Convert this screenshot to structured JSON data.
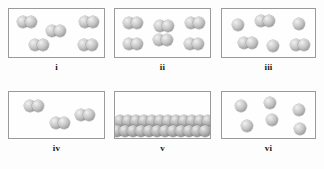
{
  "figure": {
    "title": "",
    "box_border_color": "#9a9a9a",
    "background_color": "#fdfdfd",
    "atom_fill_light": "#f2f2f2",
    "atom_fill_dark": "#787878"
  },
  "chart_data": {
    "type": "diagram",
    "title": "",
    "xlabel": "",
    "ylabel": "",
    "legend": [],
    "categories": [
      "i",
      "ii",
      "iii",
      "iv",
      "v",
      "vi"
    ],
    "values": [
      10,
      12,
      9,
      6,
      24,
      6
    ],
    "series": [
      {
        "name": "diatomic molecules",
        "values": [
          5,
          6,
          3,
          3,
          0,
          0
        ]
      },
      {
        "name": "single atoms",
        "values": [
          0,
          0,
          3,
          0,
          24,
          6
        ]
      }
    ]
  },
  "panels": [
    {
      "id": "i",
      "label": "i",
      "particle_count": 10,
      "molecule_count": 5,
      "single_atom_count": 0,
      "description": "five diatomic molecules spread in box",
      "box": {
        "x": 8,
        "y": 8,
        "w": 97,
        "h": 50
      },
      "label_pos": {
        "x": 8,
        "y": 62,
        "w": 97
      },
      "atoms": [
        {
          "x": 8,
          "y": 7,
          "r": 6
        },
        {
          "x": 16,
          "y": 7,
          "r": 6
        },
        {
          "x": 37,
          "y": 16,
          "r": 6
        },
        {
          "x": 45,
          "y": 16,
          "r": 6
        },
        {
          "x": 70,
          "y": 7,
          "r": 6
        },
        {
          "x": 78,
          "y": 7,
          "r": 6
        },
        {
          "x": 20,
          "y": 30,
          "r": 6
        },
        {
          "x": 28,
          "y": 30,
          "r": 6
        },
        {
          "x": 69,
          "y": 30,
          "r": 6
        },
        {
          "x": 77,
          "y": 30,
          "r": 6
        }
      ]
    },
    {
      "id": "ii",
      "label": "ii",
      "particle_count": 12,
      "molecule_count": 6,
      "single_atom_count": 0,
      "description": "six diatomic molecules arranged in a three by two grid",
      "box": {
        "x": 114,
        "y": 8,
        "w": 97,
        "h": 50
      },
      "label_pos": {
        "x": 114,
        "y": 62,
        "w": 97
      },
      "atoms": [
        {
          "x": 8,
          "y": 8,
          "r": 6
        },
        {
          "x": 16,
          "y": 8,
          "r": 6
        },
        {
          "x": 39,
          "y": 11,
          "r": 6
        },
        {
          "x": 47,
          "y": 11,
          "r": 6
        },
        {
          "x": 70,
          "y": 8,
          "r": 6
        },
        {
          "x": 78,
          "y": 8,
          "r": 6
        },
        {
          "x": 8,
          "y": 29,
          "r": 6
        },
        {
          "x": 16,
          "y": 29,
          "r": 6
        },
        {
          "x": 38,
          "y": 25,
          "r": 6
        },
        {
          "x": 46,
          "y": 25,
          "r": 6
        },
        {
          "x": 69,
          "y": 29,
          "r": 6
        },
        {
          "x": 77,
          "y": 29,
          "r": 6
        }
      ]
    },
    {
      "id": "iii",
      "label": "iii",
      "particle_count": 9,
      "molecule_count": 3,
      "single_atom_count": 3,
      "description": "mixture of three single atoms and three diatomic molecules",
      "box": {
        "x": 221,
        "y": 8,
        "w": 95,
        "h": 50
      },
      "label_pos": {
        "x": 221,
        "y": 62,
        "w": 95
      },
      "atoms": [
        {
          "x": 10,
          "y": 10,
          "r": 6
        },
        {
          "x": 33,
          "y": 6,
          "r": 6
        },
        {
          "x": 41,
          "y": 6,
          "r": 6
        },
        {
          "x": 71,
          "y": 9,
          "r": 6
        },
        {
          "x": 16,
          "y": 28,
          "r": 6
        },
        {
          "x": 24,
          "y": 28,
          "r": 6
        },
        {
          "x": 45,
          "y": 31,
          "r": 6
        },
        {
          "x": 68,
          "y": 30,
          "r": 6
        },
        {
          "x": 76,
          "y": 30,
          "r": 6
        }
      ]
    },
    {
      "id": "iv",
      "label": "iv",
      "particle_count": 6,
      "molecule_count": 3,
      "single_atom_count": 0,
      "description": "three widely separated diatomic molecules",
      "box": {
        "x": 8,
        "y": 91,
        "w": 97,
        "h": 48
      },
      "label_pos": {
        "x": 8,
        "y": 143,
        "w": 97
      },
      "atoms": [
        {
          "x": 15,
          "y": 8,
          "r": 6
        },
        {
          "x": 23,
          "y": 8,
          "r": 6
        },
        {
          "x": 41,
          "y": 25,
          "r": 6
        },
        {
          "x": 49,
          "y": 25,
          "r": 6
        },
        {
          "x": 66,
          "y": 17,
          "r": 6
        },
        {
          "x": 74,
          "y": 17,
          "r": 6
        }
      ]
    },
    {
      "id": "v",
      "label": "v",
      "particle_count": 24,
      "molecule_count": 0,
      "single_atom_count": 24,
      "description": "close packed atoms filling the lower portion of the box",
      "box": {
        "x": 114,
        "y": 91,
        "w": 97,
        "h": 48
      },
      "label_pos": {
        "x": 114,
        "y": 143,
        "w": 97
      },
      "atoms": [
        {
          "x": -1,
          "y": 23,
          "r": 6
        },
        {
          "x": 7,
          "y": 23,
          "r": 6
        },
        {
          "x": 15,
          "y": 23,
          "r": 6
        },
        {
          "x": 23,
          "y": 23,
          "r": 6
        },
        {
          "x": 31,
          "y": 23,
          "r": 6
        },
        {
          "x": 39,
          "y": 23,
          "r": 6
        },
        {
          "x": 47,
          "y": 23,
          "r": 6
        },
        {
          "x": 55,
          "y": 23,
          "r": 6
        },
        {
          "x": 63,
          "y": 23,
          "r": 6
        },
        {
          "x": 71,
          "y": 23,
          "r": 6
        },
        {
          "x": 79,
          "y": 23,
          "r": 6
        },
        {
          "x": 87,
          "y": 23,
          "r": 6
        },
        {
          "x": -4,
          "y": 33,
          "r": 6
        },
        {
          "x": 4,
          "y": 33,
          "r": 6
        },
        {
          "x": 12,
          "y": 33,
          "r": 6
        },
        {
          "x": 20,
          "y": 33,
          "r": 6
        },
        {
          "x": 28,
          "y": 33,
          "r": 6
        },
        {
          "x": 36,
          "y": 33,
          "r": 6
        },
        {
          "x": 44,
          "y": 33,
          "r": 6
        },
        {
          "x": 52,
          "y": 33,
          "r": 6
        },
        {
          "x": 60,
          "y": 33,
          "r": 6
        },
        {
          "x": 68,
          "y": 33,
          "r": 6
        },
        {
          "x": 76,
          "y": 33,
          "r": 6
        },
        {
          "x": 84,
          "y": 33,
          "r": 6
        }
      ]
    },
    {
      "id": "vi",
      "label": "vi",
      "particle_count": 6,
      "molecule_count": 0,
      "single_atom_count": 6,
      "description": "six separate single atoms spread through the box",
      "box": {
        "x": 221,
        "y": 91,
        "w": 95,
        "h": 48
      },
      "label_pos": {
        "x": 221,
        "y": 143,
        "w": 95
      },
      "atoms": [
        {
          "x": 13,
          "y": 8,
          "r": 6
        },
        {
          "x": 42,
          "y": 5,
          "r": 6
        },
        {
          "x": 71,
          "y": 12,
          "r": 6
        },
        {
          "x": 19,
          "y": 28,
          "r": 6
        },
        {
          "x": 44,
          "y": 22,
          "r": 6
        },
        {
          "x": 72,
          "y": 31,
          "r": 6
        }
      ]
    }
  ]
}
